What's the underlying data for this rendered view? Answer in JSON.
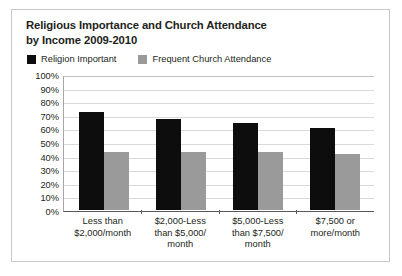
{
  "chart_data": {
    "type": "bar",
    "title": "Religious Importance and Church Attendance by Income 2009-2010",
    "title_line1": "Religious Importance and Church Attendance",
    "title_line2": "by Income 2009-2010",
    "xlabel": "",
    "ylabel": "",
    "ylim": [
      0,
      100
    ],
    "grid": true,
    "legend_position": "top-left",
    "categories": [
      "Less than $2,000/month",
      "$2,000-Less than $5,000/month",
      "$5,000-Less than $7,500/month",
      "$7,500 or more/month"
    ],
    "category_lines": [
      [
        "Less than",
        "$2,000/month"
      ],
      [
        "$2,000-Less",
        "than $5,000/",
        "month"
      ],
      [
        "$5,000-Less",
        "than $7,500/",
        "month"
      ],
      [
        "$7,500 or",
        "more/month"
      ]
    ],
    "ytick_labels": [
      "100%",
      "90%",
      "80%",
      "70%",
      "60%",
      "50%",
      "40%",
      "30%",
      "20%",
      "10%",
      "0%"
    ],
    "ytick_values": [
      100,
      90,
      80,
      70,
      60,
      50,
      40,
      30,
      20,
      10,
      0
    ],
    "series": [
      {
        "name": "Religion Important",
        "color": "#0d0d0d",
        "values": [
          72,
          67,
          64,
          60
        ]
      },
      {
        "name": "Frequent Church Attendance",
        "color": "#9a9a9a",
        "values": [
          43,
          43,
          43,
          41
        ]
      }
    ]
  },
  "legend": {
    "entries": [
      {
        "label": "Religion Important",
        "color": "#0d0d0d"
      },
      {
        "label": "Frequent Church Attendance",
        "color": "#9a9a9a"
      }
    ]
  }
}
